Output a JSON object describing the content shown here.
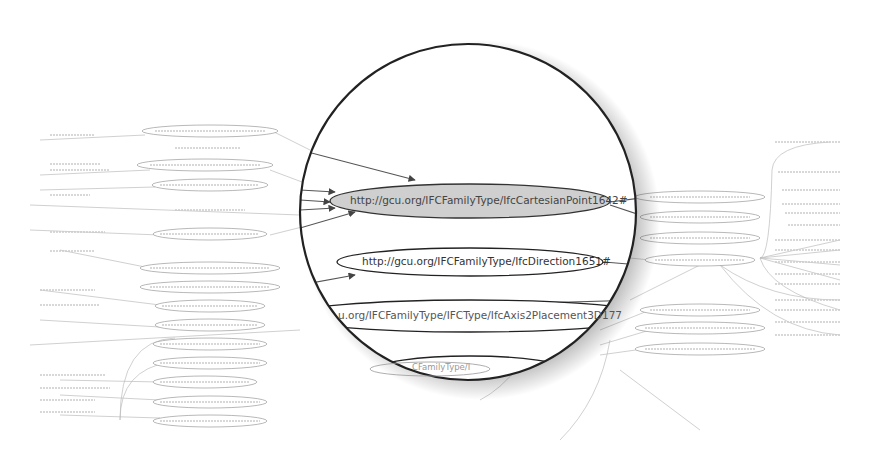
{
  "graph": {
    "title": "RDF graph view with magnifier lens",
    "lens": {
      "center_x": 468,
      "center_y": 212,
      "radius": 170,
      "nodes": [
        {
          "label": "http://gcu.org/IFCFamilyType/IfcCartesianPoint1642#",
          "highlighted": true
        },
        {
          "label": "http://gcu.org/IFCFamilyType/IfcDirection1651#",
          "highlighted": false
        },
        {
          "label": "u.org/IFCFamilyType/IFCType/IfcAxis2Placement3D177",
          "highlighted": false,
          "partial": true
        },
        {
          "label": "CFamilyType/I",
          "highlighted": false,
          "partial": true
        }
      ]
    },
    "colors": {
      "highlight_fill": "#cfcfcf",
      "lens_border": "#222222",
      "edge": "#555555",
      "bg_edge": "#b8b8b8"
    },
    "background_left_nodes": 14,
    "background_right_nodes": 7,
    "background_far_right_labels": 15
  }
}
